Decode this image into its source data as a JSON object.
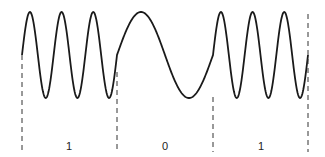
{
  "diagram": {
    "type": "fsk-waveform",
    "colors": {
      "wave": "#1a1a1a",
      "dash": "#333333",
      "text": "#222222"
    },
    "wave": {
      "center_y": 55,
      "amplitude": 43
    },
    "segments": [
      {
        "bit": "1",
        "x_start": 22,
        "x_end": 117,
        "cycles": 3
      },
      {
        "bit": "0",
        "x_start": 117,
        "x_end": 213,
        "cycles": 1
      },
      {
        "bit": "1",
        "x_start": 213,
        "x_end": 308,
        "cycles": 3
      }
    ],
    "boundaries": [
      {
        "x": 22,
        "y_top": 55
      },
      {
        "x": 117,
        "y_top": 72
      },
      {
        "x": 213,
        "y_top": 97
      },
      {
        "x": 308,
        "y_top": 14
      }
    ],
    "labels": [
      {
        "text": "1",
        "x": 69,
        "y": 150
      },
      {
        "text": "0",
        "x": 165,
        "y": 150
      },
      {
        "text": "1",
        "x": 261,
        "y": 150
      }
    ]
  }
}
